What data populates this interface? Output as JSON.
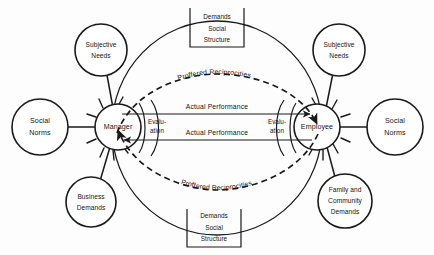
{
  "diagram": {
    "type": "systems-exchange-diagram",
    "background_color": "#fdfdfd",
    "ink_color": "#1a1a1a"
  },
  "actors": {
    "left": {
      "label": "Manager",
      "name": "manager-node"
    },
    "right": {
      "label": "Employee",
      "name": "employee-node"
    }
  },
  "evaluations": {
    "left": {
      "line1": "Evalu-",
      "line2": "ation"
    },
    "right": {
      "line1": "Evalu-",
      "line2": "ation"
    }
  },
  "environment_boxes": {
    "top": {
      "line1": "Demands",
      "line2": "Social",
      "line3": "Structure"
    },
    "bottom": {
      "line1": "Demands",
      "line2": "Social",
      "line3": "Structure"
    }
  },
  "satellites": [
    {
      "id": "left-subjective-needs",
      "line1": "Subjective",
      "line2": "Needs",
      "line3": ""
    },
    {
      "id": "left-social-norms",
      "line1": "Social",
      "line2": "Norms",
      "line3": ""
    },
    {
      "id": "left-business-demands",
      "line1": "Business",
      "line2": "Demands",
      "line3": ""
    },
    {
      "id": "right-subjective-needs",
      "line1": "Subjective",
      "line2": "Needs",
      "line3": ""
    },
    {
      "id": "right-social-norms",
      "line1": "Social",
      "line2": "Norms",
      "line3": ""
    },
    {
      "id": "right-family-community",
      "line1": "Family and",
      "line2": "Community",
      "line3": "Demands"
    }
  ],
  "flows": {
    "proffered_top": "Proffered Reciprocities",
    "performance_top": "Actual Performance",
    "performance_bottom": "Actual Performance",
    "proffered_bottom": "Proffered Reciprocities"
  }
}
